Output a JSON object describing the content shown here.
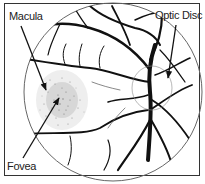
{
  "diagram": {
    "type": "retina-fundus-illustration",
    "labels": {
      "macula": "Macula",
      "optic_disc": "Optic Disc",
      "fovea": "Fovea"
    },
    "colors": {
      "vessel": "#111111",
      "outline": "#555555",
      "frame": "#333333",
      "stipple": "#444444",
      "background": "#ffffff"
    }
  }
}
